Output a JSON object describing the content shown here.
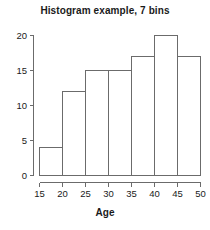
{
  "chart_data": {
    "type": "bar",
    "title": "Histogram example, 7 bins",
    "xlabel": "Age",
    "ylabel": "",
    "categories": [
      "15-20",
      "20-25",
      "25-30",
      "30-35",
      "35-40",
      "40-45",
      "45-50"
    ],
    "bin_edges": [
      15,
      20,
      25,
      30,
      35,
      40,
      45,
      50
    ],
    "values": [
      4,
      12,
      15,
      15,
      17,
      20,
      17
    ],
    "xlim": [
      15,
      50
    ],
    "ylim": [
      0,
      20
    ],
    "xticks": [
      15,
      20,
      25,
      30,
      35,
      40,
      45,
      50
    ],
    "yticks": [
      0,
      5,
      10,
      15,
      20
    ],
    "xtick_labels": [
      "15",
      "20",
      "25",
      "30",
      "35",
      "40",
      "45",
      "50"
    ],
    "ytick_labels": [
      "0",
      "5",
      "10",
      "15",
      "20"
    ],
    "grid": false,
    "legend": null,
    "bar_fill_color": "#ffffff",
    "bar_edge_color": "#6b6b6b",
    "axis_color": "#6b6b6b",
    "text_color": "#1a1a1a",
    "background_color": "#ffffff"
  }
}
